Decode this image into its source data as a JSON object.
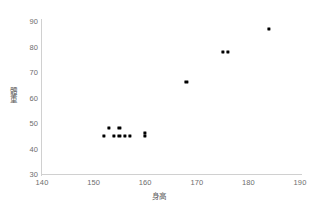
{
  "chart_data": {
    "type": "scatter",
    "title": "",
    "xlabel": "身高",
    "ylabel": "體重",
    "xlim": [
      140,
      190
    ],
    "ylim": [
      30,
      90
    ],
    "xticks": [
      140,
      150,
      160,
      170,
      180,
      190
    ],
    "yticks": [
      30,
      40,
      50,
      60,
      70,
      80,
      90
    ],
    "grid": false,
    "legend": false,
    "marker_color": "#000000",
    "axis_color": "#d0d0d0",
    "tick_label_color": "#6d6d6d",
    "points": [
      {
        "x": 152,
        "y": 45
      },
      {
        "x": 153,
        "y": 48
      },
      {
        "x": 155,
        "y": 48
      },
      {
        "x": 154,
        "y": 45
      },
      {
        "x": 155,
        "y": 45
      },
      {
        "x": 156,
        "y": 45
      },
      {
        "x": 157,
        "y": 45
      },
      {
        "x": 160,
        "y": 46
      },
      {
        "x": 160,
        "y": 45
      },
      {
        "x": 168,
        "y": 66
      },
      {
        "x": 175,
        "y": 78
      },
      {
        "x": 176,
        "y": 78
      },
      {
        "x": 184,
        "y": 87
      }
    ]
  }
}
